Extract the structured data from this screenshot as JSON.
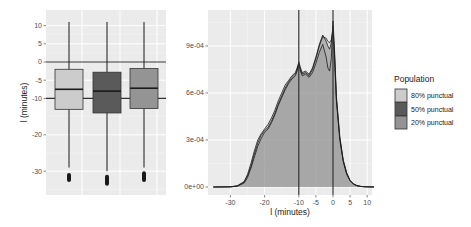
{
  "chart_data": [
    {
      "type": "box",
      "title": "",
      "xlabel": "",
      "ylabel": "l  (minutes)",
      "ylim": [
        -34,
        12
      ],
      "yticks": [
        10,
        5,
        0,
        -5,
        -10,
        -20,
        -30
      ],
      "ytick_labels": [
        "10",
        "5",
        "0",
        "-5",
        "-10",
        "-20",
        "-30"
      ],
      "hlines": [
        0,
        -10
      ],
      "grid": true,
      "series": [
        {
          "name": "80% punctual",
          "fill": "#cccccc",
          "whisker_high": 11,
          "q3": -2,
          "median": -7.5,
          "q1": -13,
          "whisker_low": -29,
          "outlier_low": -33,
          "outlier_high": -30.5
        },
        {
          "name": "50% punctual",
          "fill": "#5a5a5a",
          "whisker_high": 11,
          "q3": -2.8,
          "median": -8,
          "q1": -14,
          "whisker_low": -30,
          "outlier_low": -34,
          "outlier_high": -31
        },
        {
          "name": "20% punctual",
          "fill": "#949494",
          "whisker_high": 11,
          "q3": -1.8,
          "median": -7.2,
          "q1": -12.8,
          "whisker_low": -29,
          "outlier_low": -33,
          "outlier_high": -30
        }
      ]
    },
    {
      "type": "area",
      "title": "",
      "xlabel": "l  (minutes)",
      "ylabel": "",
      "xlim": [
        -35,
        12
      ],
      "ylim": [
        0,
        0.00108
      ],
      "xticks": [
        -30,
        -20,
        -10,
        -5,
        0,
        5,
        10
      ],
      "xtick_labels": [
        "-30",
        "-20",
        "-10",
        "-5",
        "0",
        "5",
        "10"
      ],
      "yticks": [
        0,
        0.0003,
        0.0006,
        0.0009
      ],
      "ytick_labels": [
        "0e+00",
        "3e-04",
        "6e-04",
        "9e-04"
      ],
      "vlines": [
        -10,
        0
      ],
      "grid": true,
      "legend": {
        "title": "Population",
        "position": "right"
      },
      "x": [
        -35,
        -30,
        -28,
        -26,
        -25,
        -24,
        -23,
        -22,
        -21,
        -20,
        -19,
        -18,
        -17,
        -16,
        -15,
        -14,
        -13,
        -12,
        -11,
        -10.5,
        -10,
        -9.5,
        -9,
        -8,
        -7,
        -6,
        -5,
        -4,
        -3,
        -2,
        -1.5,
        -1,
        -0.5,
        0,
        0.5,
        1,
        2,
        3,
        4,
        5,
        6,
        7,
        8,
        9,
        10,
        12
      ],
      "series": [
        {
          "name": "80% punctual",
          "fill": "#cccccc",
          "values": [
            0,
            1e-06,
            6e-06,
            3e-05,
            7e-05,
            0.00013,
            0.00021,
            0.00028,
            0.00033,
            0.00036,
            0.00038,
            0.00042,
            0.00047,
            0.00053,
            0.00058,
            0.00063,
            0.00067,
            0.0007,
            0.00072,
            0.00075,
            0.00078,
            0.00075,
            0.00072,
            0.00073,
            0.00071,
            0.00075,
            0.00082,
            0.0009,
            0.00096,
            0.00095,
            0.00093,
            0.00092,
            0.00094,
            0.001,
            0.0008,
            0.00055,
            0.0003,
            0.00016,
            8e-05,
            4e-05,
            1.8e-05,
            8e-06,
            4e-06,
            2e-06,
            1e-06,
            0
          ]
        },
        {
          "name": "50% punctual",
          "fill": "#5a5a5a",
          "values": [
            0,
            1e-06,
            5e-06,
            2.5e-05,
            6e-05,
            0.00012,
            0.00019,
            0.00026,
            0.00031,
            0.00035,
            0.00037,
            0.00041,
            0.00046,
            0.00052,
            0.00057,
            0.00062,
            0.00066,
            0.00069,
            0.00071,
            0.00074,
            0.0008,
            0.00076,
            0.00073,
            0.00074,
            0.00072,
            0.00076,
            0.00083,
            0.00091,
            0.00097,
            0.00093,
            0.0009,
            0.00088,
            0.00092,
            0.00103,
            0.00082,
            0.00056,
            0.00031,
            0.00017,
            9e-05,
            4e-05,
            2e-05,
            9e-06,
            4e-06,
            2e-06,
            1e-06,
            0
          ]
        },
        {
          "name": "20% punctual",
          "fill": "#949494",
          "values": [
            0,
            1e-06,
            8e-06,
            3.5e-05,
            8e-05,
            0.00015,
            0.00023,
            0.0003,
            0.00034,
            0.00037,
            0.0004,
            0.00044,
            0.00049,
            0.00055,
            0.0006,
            0.00065,
            0.00068,
            0.00071,
            0.00073,
            0.00076,
            0.00079,
            0.00074,
            0.00071,
            0.00072,
            0.0007,
            0.00073,
            0.00079,
            0.00086,
            0.00091,
            0.00083,
            0.00076,
            0.00074,
            0.00082,
            0.00106,
            0.00085,
            0.00058,
            0.00032,
            0.00017,
            9e-05,
            4e-05,
            2e-05,
            9e-06,
            4e-06,
            2e-06,
            1e-06,
            0
          ]
        }
      ]
    }
  ],
  "legend": {
    "title": "Population",
    "items": [
      {
        "label": "80% punctual",
        "color": "#cccccc"
      },
      {
        "label": "50% punctual",
        "color": "#5a5a5a"
      },
      {
        "label": "20% punctual",
        "color": "#949494"
      }
    ]
  },
  "colors": {
    "panel_bg": "#ebebeb",
    "grid_major": "#ffffff",
    "reference_line": "#333333",
    "outline": "#1a1a1a"
  }
}
